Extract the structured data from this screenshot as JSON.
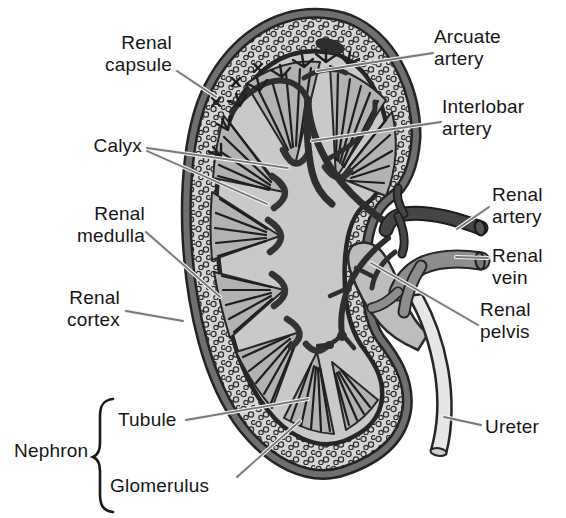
{
  "labels": {
    "renal_capsule": "Renal\ncapsule",
    "calyx": "Calyx",
    "renal_medulla": "Renal\nmedulla",
    "renal_cortex": "Renal\ncortex",
    "arcuate_artery": "Arcuate\nartery",
    "interlobar_artery": "Interlobar\nartery",
    "renal_artery": "Renal\nartery",
    "renal_vein": "Renal\nvein",
    "renal_pelvis": "Renal\npelvis",
    "ureter": "Ureter",
    "nephron": "Nephron",
    "tubule": "Tubule",
    "glomerulus": "Glomerulus"
  },
  "colors": {
    "background": "#ffffff",
    "text": "#161616",
    "capsule_outline": "#242424",
    "capsule_ring": "#6f6f6f",
    "cortex_fill": "#d6d6d6",
    "stipple_stroke": "#2f2f2f",
    "sinus_fill": "#c9c9c9",
    "medulla_fill": "#b2b2b2",
    "medulla_stripe": "#1e1e1e",
    "artery_vessel": "#454545",
    "vein_vessel": "#8d8d8d",
    "pelvis_fill": "#bdbdbd",
    "ureter_fill": "#e6e6e6",
    "leader_line": "#787878"
  }
}
